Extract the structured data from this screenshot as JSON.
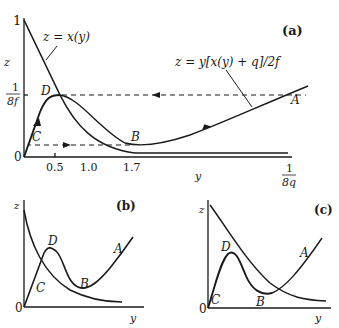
{
  "panel_a": {
    "tag": "(a)",
    "z_label": "z",
    "y_label": "y",
    "origin_label": "0",
    "z_tick_one": "1",
    "z_tick_frac_num": "1",
    "z_tick_frac_den": "8f",
    "y_ticks": [
      "0.5",
      "1.0",
      "1.7"
    ],
    "y_end_num": "1",
    "y_end_den": "8q",
    "curve1_label": "z = x(y)",
    "curve2_label": "z = y[x(y) + q]/2f",
    "points": {
      "A": "A",
      "B": "B",
      "C": "C",
      "D": "D"
    }
  },
  "panel_b": {
    "tag": "(b)",
    "z_label": "z",
    "y_label": "y",
    "origin_label": "0",
    "points": {
      "A": "A",
      "B": "B",
      "C": "C",
      "D": "D"
    }
  },
  "panel_c": {
    "tag": "(c)",
    "z_label": "z",
    "y_label": "y",
    "origin_label": "0",
    "points": {
      "A": "A",
      "B": "B",
      "C": "C",
      "D": "D"
    }
  },
  "colors": {
    "ink": "#1a1a1a",
    "background": "#ffffff"
  }
}
